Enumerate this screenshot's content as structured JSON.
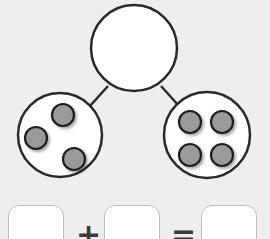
{
  "diagram": {
    "type": "number-bond",
    "whole": {
      "value": "",
      "empty": true
    },
    "parts": [
      {
        "name": "left",
        "counters": 3
      },
      {
        "name": "right",
        "counters": 4
      }
    ],
    "colors": {
      "background": "#eeeeee",
      "circle_fill": "#ffffff",
      "stroke": "#2a2a2a",
      "counter_fill": "#9a9a9a"
    }
  },
  "equation": {
    "boxes": [
      "",
      "",
      ""
    ],
    "plus": "+",
    "equals": "="
  }
}
